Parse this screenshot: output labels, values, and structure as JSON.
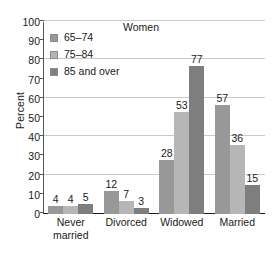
{
  "chart_data": {
    "type": "bar",
    "title": "Women",
    "xlabel": "",
    "ylabel": "Percent",
    "ylim": [
      0,
      100
    ],
    "ytick_step": 10,
    "gridline_step": 20,
    "grid": true,
    "legend_position": "upper-left-inside",
    "categories": [
      "Never married",
      "Divorced",
      "Widowed",
      "Married"
    ],
    "series": [
      {
        "name": "65–74",
        "values": [
          4,
          12,
          28,
          57
        ],
        "color": "#989898"
      },
      {
        "name": "75–84",
        "values": [
          4,
          7,
          53,
          36
        ],
        "color": "#b6b6b6"
      },
      {
        "name": "85 and over",
        "values": [
          5,
          3,
          77,
          15
        ],
        "color": "#7e7e7e"
      }
    ],
    "ytick_labels": [
      "100",
      "90",
      "80",
      "70",
      "60",
      "50",
      "40",
      "30",
      "20",
      "10",
      "0"
    ],
    "gridline_values": [
      100,
      80,
      60,
      40,
      20
    ],
    "category_labels_wrapped": [
      [
        "Never",
        "married"
      ],
      [
        "Divorced"
      ],
      [
        "Widowed"
      ],
      [
        "Married"
      ]
    ]
  },
  "colors": {
    "grid": "#c9c9c9",
    "axis": "#1a1a1a",
    "text": "#1a1a1a",
    "background": "#ffffff",
    "legend_swatch_border": "#8c8c8c"
  }
}
